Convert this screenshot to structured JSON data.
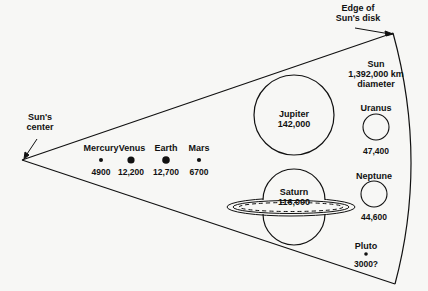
{
  "diagram": {
    "colors": {
      "ink": "#111111",
      "background": "#f7f7f5"
    },
    "sun": {
      "center_label_line1": "Sun's",
      "center_label_line2": "center",
      "edge_label_line1": "Edge of",
      "edge_label_line2": "Sun's disk",
      "name": "Sun",
      "diameter_value": "1,392,000 km",
      "diameter_word": "diameter"
    },
    "planets": [
      {
        "name": "Mercury",
        "diameter": "4900"
      },
      {
        "name": "Venus",
        "diameter": "12,200"
      },
      {
        "name": "Earth",
        "diameter": "12,700"
      },
      {
        "name": "Mars",
        "diameter": "6700"
      },
      {
        "name": "Jupiter",
        "diameter": "142,000"
      },
      {
        "name": "Saturn",
        "diameter": "116,000"
      },
      {
        "name": "Uranus",
        "diameter": "47,400"
      },
      {
        "name": "Neptune",
        "diameter": "44,600"
      },
      {
        "name": "Pluto",
        "diameter": "3000?"
      }
    ]
  }
}
